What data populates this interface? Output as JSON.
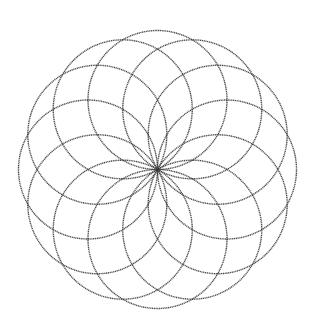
{
  "figure": {
    "circle_count": 12,
    "angle_step_degrees": 30,
    "line_color": "#3a3a3a",
    "background_color": "#ffffff"
  }
}
